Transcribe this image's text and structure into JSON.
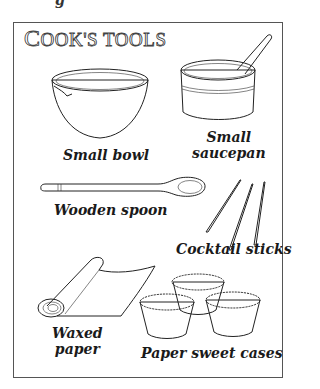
{
  "page": {
    "heading_glyph": "g"
  },
  "title": {
    "first_letter": "C",
    "rest": "OOK'S TOOLS",
    "full": "COOK'S TOOLS"
  },
  "items": [
    {
      "id": "small-bowl",
      "label": "Small bowl",
      "icon": "bowl-icon"
    },
    {
      "id": "small-saucepan",
      "label_line1": "Small",
      "label_line2": "saucepan",
      "icon": "saucepan-icon"
    },
    {
      "id": "wooden-spoon",
      "label": "Wooden spoon",
      "icon": "spoon-icon"
    },
    {
      "id": "cocktail-sticks",
      "label": "Cocktail sticks",
      "icon": "cocktail-sticks-icon"
    },
    {
      "id": "waxed-paper",
      "label_line1": "Waxed",
      "label_line2": "paper",
      "icon": "waxed-paper-roll-icon"
    },
    {
      "id": "paper-sweet-cases",
      "label": "Paper sweet cases",
      "icon": "paper-cases-icon"
    }
  ],
  "colors": {
    "ink": "#222222",
    "border": "#555555",
    "background": "#ffffff"
  }
}
